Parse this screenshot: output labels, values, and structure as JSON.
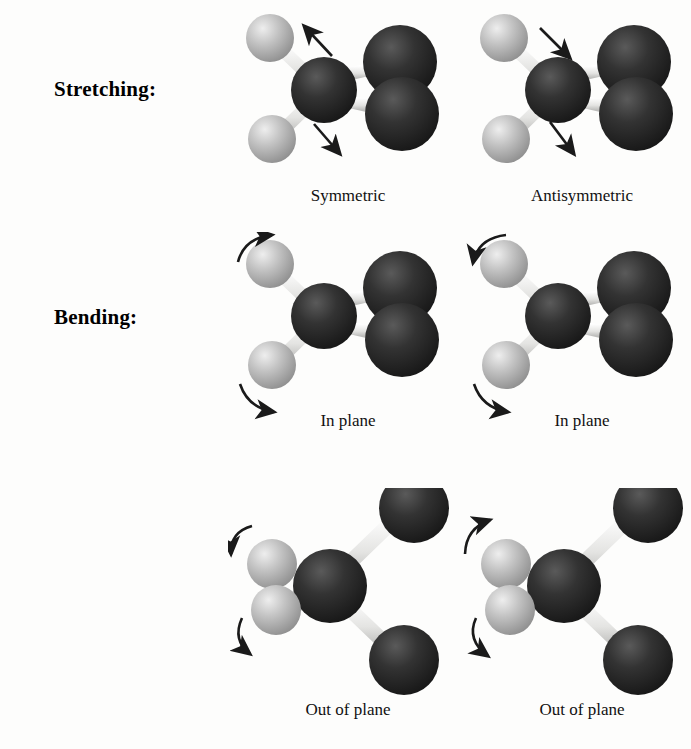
{
  "figure": {
    "background_color": "#fdfdfc",
    "row_labels": {
      "stretching": "Stretching:",
      "bending": "Bending:"
    },
    "captions": {
      "r1c1": "Symmetric",
      "r1c2": "Antisymmetric",
      "r2c1": "In plane",
      "r2c2": "In plane",
      "r3c1": "Out of plane",
      "r3c2": "Out of plane"
    },
    "colors": {
      "hydrogen_atom": "#b9b9b9",
      "hydrogen_highlight": "#e6e6e6",
      "heavy_atom": "#2b2b2b",
      "heavy_atom_highlight": "#4f4f4f",
      "bond": "#e8e8e6",
      "arrow": "#1a1a1a",
      "text": "#111111"
    },
    "molecule": {
      "description": "ball-and-stick model, central heavy atom with two light hydrogen atoms at left and two dark heavy atoms at right",
      "atom_counts": {
        "light_atoms": 2,
        "dark_atoms": 3
      }
    },
    "modes": [
      {
        "id": "r1c1",
        "type": "stretching",
        "caption": "Symmetric",
        "arrow_style": "straight",
        "arrow_count": 2,
        "arrow_directions": [
          "up-left",
          "down-left"
        ],
        "orientation": "in-plane-view"
      },
      {
        "id": "r1c2",
        "type": "stretching",
        "caption": "Antisymmetric",
        "arrow_style": "straight",
        "arrow_count": 2,
        "arrow_directions": [
          "down-right",
          "down-left"
        ],
        "orientation": "in-plane-view"
      },
      {
        "id": "r2c1",
        "type": "bending",
        "caption": "In plane",
        "arrow_style": "curved",
        "arrow_count": 2,
        "arrow_directions": [
          "curve-up-right",
          "curve-down-right"
        ],
        "orientation": "in-plane-view"
      },
      {
        "id": "r2c2",
        "type": "bending",
        "caption": "In plane",
        "arrow_style": "curved",
        "arrow_count": 2,
        "arrow_directions": [
          "curve-down-left",
          "curve-down-right"
        ],
        "orientation": "in-plane-view"
      },
      {
        "id": "r3c1",
        "type": "bending",
        "caption": "Out of plane",
        "arrow_style": "curved",
        "arrow_count": 2,
        "arrow_directions": [
          "curve-down-left",
          "curve-down-left"
        ],
        "orientation": "edge-on-view"
      },
      {
        "id": "r3c2",
        "type": "bending",
        "caption": "Out of plane",
        "arrow_style": "curved",
        "arrow_count": 2,
        "arrow_directions": [
          "curve-up-left",
          "curve-down-right"
        ],
        "orientation": "edge-on-view"
      }
    ]
  }
}
